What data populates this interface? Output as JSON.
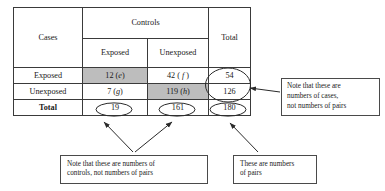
{
  "figure": {
    "caption_absent": true,
    "colors": {
      "shade_gray": "#bdbdbd",
      "line": "#3a3a3a",
      "text": "#1a1a1a",
      "background": "#ffffff"
    }
  },
  "table": {
    "corner_label": "Cases",
    "group_header": "Controls",
    "total_header": "Total",
    "sub_headers": {
      "exposed": "Exposed",
      "unexposed": "Unexposed",
      "total_blank": ""
    },
    "rows": [
      {
        "label": "Exposed",
        "exposed": "12 (e)",
        "exposed_value": "12",
        "exposed_tag": "e",
        "exposed_shaded": true,
        "unexposed": "42 ( f )",
        "unexposed_value": "42",
        "unexposed_tag": "f",
        "unexposed_shaded": false,
        "total": "54",
        "total_circled": true
      },
      {
        "label": "Unexposed",
        "exposed": "7 (g)",
        "exposed_value": "7",
        "exposed_tag": "g",
        "exposed_shaded": false,
        "unexposed": "119 (h)",
        "unexposed_value": "119",
        "unexposed_tag": "h",
        "unexposed_shaded": true,
        "total": "126",
        "total_circled": true
      }
    ],
    "total_row": {
      "label": "Total",
      "exposed": "19",
      "unexposed": "161",
      "total": "180",
      "all_circled": true
    }
  },
  "annotations": [
    {
      "id": "note-cases",
      "lines": [
        "Note that these are",
        "numbers of cases,",
        "not numbers of pairs"
      ],
      "points_to": [
        "54",
        "126"
      ]
    },
    {
      "id": "note-controls",
      "lines": [
        "Note that these are numbers of",
        "controls, not numbers of pairs"
      ],
      "points_to": [
        "19",
        "161"
      ]
    },
    {
      "id": "note-pairs",
      "lines": [
        "These are numbers",
        "of pairs"
      ],
      "points_to": [
        "180"
      ]
    }
  ]
}
